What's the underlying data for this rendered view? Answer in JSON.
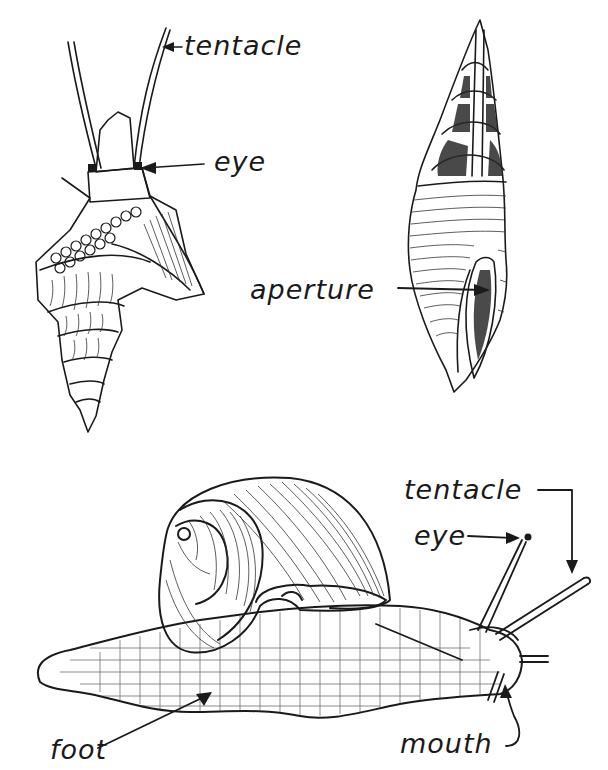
{
  "figure": {
    "type": "labeled anatomical illustration",
    "ink_color": "#1a1a1a",
    "background": "#ffffff"
  },
  "panels": [
    {
      "id": "top-left-spiny-shell",
      "description": "Marine gastropod with turreted, knobbed shell; head with two long tentacles and eyes at their bases",
      "labels": [
        {
          "text": "tentacle",
          "points_to": "right tentacle"
        },
        {
          "text": "eye",
          "points_to": "eye at base of tentacle"
        }
      ]
    },
    {
      "id": "top-right-cone-shell",
      "description": "Elongated spired shell, upper whorls cut away to show internal columella; ribbed body whorl with aperture",
      "labels": [
        {
          "text": "aperture",
          "points_to": "shell opening"
        }
      ]
    },
    {
      "id": "bottom-land-snail",
      "description": "Land snail with coiled shell on a reticulated muscular foot, extended tentacles",
      "labels": [
        {
          "text": "tentacle",
          "points_to": "lower (posterior) tentacle"
        },
        {
          "text": "eye",
          "points_to": "eye at tip of upper tentacle"
        },
        {
          "text": "foot",
          "points_to": "underside of body"
        },
        {
          "text": "mouth",
          "points_to": "front of head"
        }
      ]
    }
  ],
  "labels": {
    "top_tentacle": "tentacle",
    "top_eye": "eye",
    "aperture": "aperture",
    "bottom_tentacle": "tentacle",
    "bottom_eye": "eye",
    "foot": "foot",
    "mouth": "mouth"
  }
}
